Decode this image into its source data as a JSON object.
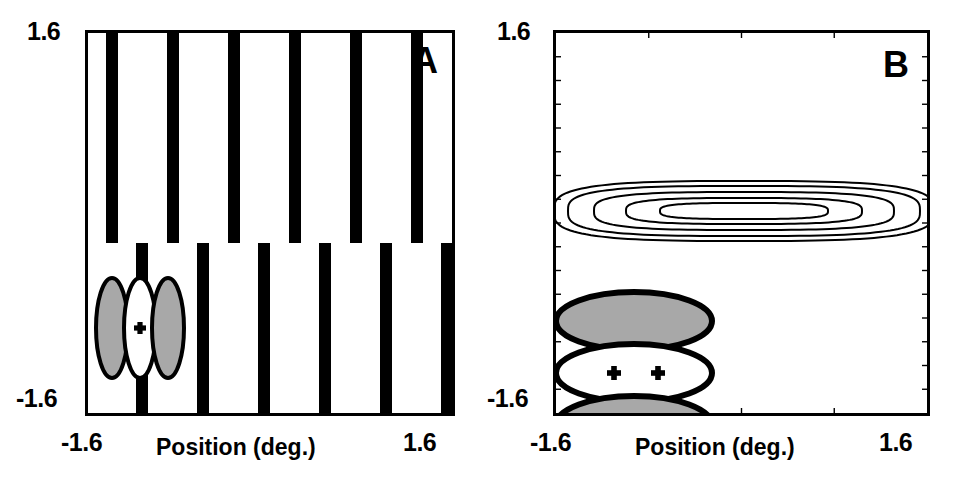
{
  "figure": {
    "background": "#ffffff",
    "ink": "#000000",
    "gray_fill": "#a8a8a8",
    "panels": [
      "A",
      "B"
    ]
  },
  "panel_a": {
    "letter": "A",
    "axis": {
      "y_top_label": "1.6",
      "y_bottom_label": "-1.6",
      "x_left_label": "-1.6",
      "x_right_label": "1.6",
      "x_title": "Position (deg.)"
    },
    "stimulus": {
      "type": "phase-shifted vertical square-wave grating",
      "bar_color": "#000000",
      "background_color": "#ffffff",
      "bar_width_px": 12,
      "period_px": 61,
      "split_y_px": 210,
      "top_bar_left_positions_px": [
        18,
        79,
        140,
        201,
        262,
        323
      ],
      "bottom_bar_left_positions_px": [
        48,
        109,
        170,
        231,
        292,
        353
      ]
    },
    "receptive_field": {
      "description": "odd-symmetric simple-cell receptive field, three vertically elongated lobes",
      "center_marker": "+",
      "marker_count": 1,
      "lobes": [
        {
          "polarity": "off",
          "fill": "#a8a8a8",
          "cx": 24,
          "cy": 295,
          "rx": 16,
          "ry": 50
        },
        {
          "polarity": "on",
          "fill": "#ffffff",
          "cx": 52,
          "cy": 295,
          "rx": 16,
          "ry": 50
        },
        {
          "polarity": "off",
          "fill": "#a8a8a8",
          "cx": 80,
          "cy": 295,
          "rx": 16,
          "ry": 50
        }
      ]
    }
  },
  "panel_b": {
    "letter": "B",
    "axis": {
      "y_top_label": "1.6",
      "y_bottom_label": "-1.6",
      "x_left_label": "-1.6",
      "x_right_label": "1.6",
      "x_title": "Position (deg.)",
      "tick_marks": "inward minor ticks on all four edges"
    },
    "receptive_field": {
      "description": "receptive field with three horizontally elongated lobes stacked vertically",
      "center_marker": "+",
      "marker_count": 2,
      "lobes": [
        {
          "polarity": "off",
          "fill": "#a8a8a8",
          "cx": 78,
          "cy": 288,
          "rx": 78,
          "ry": 29
        },
        {
          "polarity": "on",
          "fill": "#ffffff",
          "cx": 78,
          "cy": 340,
          "rx": 78,
          "ry": 29
        },
        {
          "polarity": "off",
          "fill": "#a8a8a8",
          "cx": 78,
          "cy": 392,
          "rx": 78,
          "ry": 29
        }
      ],
      "markers": [
        {
          "x": 58,
          "y": 340
        },
        {
          "x": 102,
          "y": 340
        }
      ]
    },
    "contour_plot": {
      "description": "nested horizontally elongated response contours centred above the receptive field",
      "levels": 5,
      "line_color": "#000000",
      "center_x_px": 188,
      "center_y_px": 178,
      "level_rx_px": [
        190,
        176,
        150,
        118,
        84
      ],
      "level_ry_px": [
        30,
        25,
        19,
        13,
        8
      ]
    }
  },
  "chart_data": {
    "type": "scatter",
    "title": "",
    "xlabel": "Position (deg.)",
    "ylabel": "",
    "xlim": [
      -1.6,
      1.6
    ],
    "ylim": [
      -1.6,
      1.6
    ],
    "grid": false,
    "legend": null,
    "panels": [
      {
        "name": "A",
        "content": "vertical square-wave grating split horizontally into two half-fields offset by half a spatial period; overlaid odd-symmetric receptive-field schematic (grey-white-grey vertical ellipses) at lower left with a '+' marker",
        "grating": {
          "orientation": "vertical",
          "period_deg": 0.53,
          "duty_cycle": 0.2,
          "phase_offset_deg": 0.26,
          "split_y_deg": 0.14
        },
        "rf_lobes_deg": [
          {
            "polarity": "off",
            "x": -1.39,
            "y": -0.85,
            "rx": 0.14,
            "ry": 0.41
          },
          {
            "polarity": "on",
            "x": -1.15,
            "y": -0.85,
            "rx": 0.14,
            "ry": 0.41
          },
          {
            "polarity": "off",
            "x": -0.91,
            "y": -0.85,
            "rx": 0.14,
            "ry": 0.41
          }
        ]
      },
      {
        "name": "B",
        "content": "contour map of response amplitude: five nested, horizontally elongated iso-response contours centred near y = +0.13 deg; receptive-field schematic (grey-white-grey horizontal ellipses) at lower left with two '+' markers",
        "contour_levels": 5,
        "contour_center_deg": {
          "x": 0.03,
          "y": 0.13
        },
        "contour_semi_axes_deg": [
          {
            "rx": 1.57,
            "ry": 0.25
          },
          {
            "rx": 1.45,
            "ry": 0.21
          },
          {
            "rx": 1.24,
            "ry": 0.16
          },
          {
            "rx": 0.98,
            "ry": 0.11
          },
          {
            "rx": 0.7,
            "ry": 0.07
          }
        ],
        "rf_lobes_deg": [
          {
            "polarity": "off",
            "x": -0.95,
            "y": -0.53,
            "rx": 0.65,
            "ry": 0.24
          },
          {
            "polarity": "on",
            "x": -0.95,
            "y": -0.96,
            "rx": 0.65,
            "ry": 0.24
          },
          {
            "polarity": "off",
            "x": -0.95,
            "y": -1.39,
            "rx": 0.65,
            "ry": 0.24
          }
        ]
      }
    ]
  }
}
